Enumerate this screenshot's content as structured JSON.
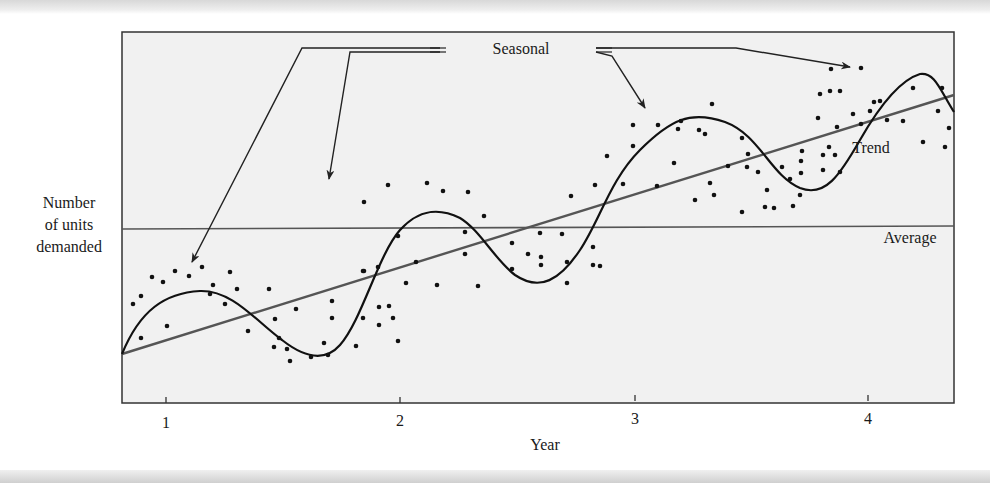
{
  "chart_data": {
    "type": "scatter",
    "title": "",
    "xlabel": "Year",
    "ylabel": "Number of units demanded",
    "ylabel_lines": [
      "Number",
      "of units",
      "demanded"
    ],
    "x_ticks": [
      "1",
      "2",
      "3",
      "4"
    ],
    "xlim": [
      0.81,
      4.37
    ],
    "y_ticks": [],
    "grid": false,
    "legend": "none",
    "annotations": {
      "seasonal": "Seasonal",
      "trend": "Trend",
      "average": "Average"
    },
    "series": [
      {
        "name": "Demand observations",
        "kind": "scatter",
        "points_px": [
          [
            133,
            304
          ],
          [
            141,
            296
          ],
          [
            152,
            277
          ],
          [
            163,
            282
          ],
          [
            175,
            271
          ],
          [
            189,
            276
          ],
          [
            202,
            267
          ],
          [
            210,
            294
          ],
          [
            213,
            285
          ],
          [
            230,
            272
          ],
          [
            237,
            289
          ],
          [
            225,
            304
          ],
          [
            141,
            338
          ],
          [
            167,
            326
          ],
          [
            248,
            331
          ],
          [
            269,
            289
          ],
          [
            275,
            319
          ],
          [
            279,
            338
          ],
          [
            274,
            347
          ],
          [
            296,
            309
          ],
          [
            287,
            349
          ],
          [
            290,
            361
          ],
          [
            311,
            357
          ],
          [
            332,
            301
          ],
          [
            332,
            318
          ],
          [
            324,
            343
          ],
          [
            328,
            355
          ],
          [
            356,
            346
          ],
          [
            363,
            318
          ],
          [
            363,
            271
          ],
          [
            379,
            307
          ],
          [
            378,
            267
          ],
          [
            364,
            202
          ],
          [
            388,
            185
          ],
          [
            427,
            183
          ],
          [
            468,
            192
          ],
          [
            443,
            191
          ],
          [
            484,
            216
          ],
          [
            465,
            232
          ],
          [
            398,
            236
          ],
          [
            364,
            271
          ],
          [
            465,
            254
          ],
          [
            416,
            262
          ],
          [
            393,
            318
          ],
          [
            406,
            283
          ],
          [
            389,
            306
          ],
          [
            379,
            325
          ],
          [
            398,
            341
          ],
          [
            437,
            285
          ],
          [
            478,
            286
          ],
          [
            512,
            243
          ],
          [
            540,
            233
          ],
          [
            562,
            234
          ],
          [
            541,
            257
          ],
          [
            528,
            254
          ],
          [
            593,
            247
          ],
          [
            512,
            269
          ],
          [
            541,
            265
          ],
          [
            567,
            262
          ],
          [
            593,
            265
          ],
          [
            567,
            283
          ],
          [
            600,
            266
          ],
          [
            633,
            125
          ],
          [
            658,
            125
          ],
          [
            633,
            146
          ],
          [
            607,
            156
          ],
          [
            595,
            185
          ],
          [
            623,
            184
          ],
          [
            657,
            186
          ],
          [
            571,
            196
          ],
          [
            681,
            121
          ],
          [
            678,
            129
          ],
          [
            699,
            130
          ],
          [
            705,
            134
          ],
          [
            712,
            104
          ],
          [
            742,
            138
          ],
          [
            748,
            154
          ],
          [
            747,
            167
          ],
          [
            758,
            172
          ],
          [
            714,
            195
          ],
          [
            728,
            166
          ],
          [
            710,
            183
          ],
          [
            767,
            190
          ],
          [
            790,
            179
          ],
          [
            801,
            161
          ],
          [
            802,
            151
          ],
          [
            823,
            155
          ],
          [
            782,
            167
          ],
          [
            800,
            195
          ],
          [
            801,
            173
          ],
          [
            774,
            208
          ],
          [
            742,
            212
          ],
          [
            765,
            207
          ],
          [
            793,
            206
          ],
          [
            674,
            163
          ],
          [
            695,
            200
          ],
          [
            831,
            69
          ],
          [
            861,
            68
          ],
          [
            830,
            91
          ],
          [
            840,
            91
          ],
          [
            870,
            111
          ],
          [
            874,
            102
          ],
          [
            913,
            88
          ],
          [
            942,
            88
          ],
          [
            880,
            101
          ],
          [
            820,
            94
          ],
          [
            853,
            114
          ],
          [
            861,
            124
          ],
          [
            887,
            120
          ],
          [
            903,
            121
          ],
          [
            818,
            118
          ],
          [
            938,
            111
          ],
          [
            949,
            128
          ],
          [
            837,
            127
          ],
          [
            829,
            147
          ],
          [
            835,
            155
          ],
          [
            923,
            142
          ],
          [
            945,
            147
          ],
          [
            823,
            170
          ],
          [
            840,
            172
          ]
        ]
      },
      {
        "name": "Trend",
        "kind": "line",
        "x": [
          0.81,
          4.37
        ],
        "relative_level": [
          0.0,
          0.78
        ]
      },
      {
        "name": "Average",
        "kind": "hline",
        "relative_level": 0.47
      },
      {
        "name": "Seasonal",
        "kind": "curve",
        "description": "sinusoid around trend, peaks near years 1.15, 2.15, 3.1, 4.1"
      }
    ]
  },
  "figure": {
    "seasonal_label": "Seasonal",
    "trend_label": "Trend",
    "average_label": "Average",
    "x_axis_label": "Year",
    "y_axis_label": [
      "Number",
      "of units",
      "demanded"
    ],
    "x_tick_labels": [
      "1",
      "2",
      "3",
      "4"
    ]
  }
}
